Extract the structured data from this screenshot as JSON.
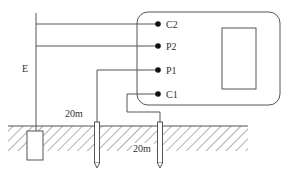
{
  "diagram": {
    "terminals": [
      {
        "id": "C2",
        "label": "C2"
      },
      {
        "id": "P2",
        "label": "P2"
      },
      {
        "id": "P1",
        "label": "P1"
      },
      {
        "id": "C1",
        "label": "C1"
      }
    ],
    "earth_label": "E",
    "distances": [
      {
        "label": "20m",
        "between": "E to P1"
      },
      {
        "label": "20m",
        "between": "P1 to C1"
      }
    ],
    "colors": {
      "line": "#555555",
      "text": "#333333",
      "background": "#ffffff"
    }
  }
}
